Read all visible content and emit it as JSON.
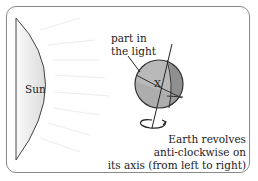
{
  "diagram": {
    "sun_label": "Sun",
    "light_label_line1": "part in",
    "light_label_line2": "the light",
    "point_label": "X",
    "caption_line1": "Earth revolves",
    "caption_line2": "anti-clockwise on",
    "caption_line3": "its axis (from left to right)"
  },
  "colors": {
    "sun_fill": "#e6e6e6",
    "globe_light": "#b9b9b9",
    "globe_dark": "#8f8f8f",
    "frame": "#8a8a8a"
  }
}
